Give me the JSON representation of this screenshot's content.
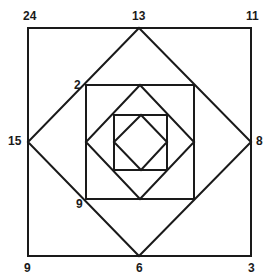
{
  "diagram": {
    "stroke_color": "#1a1a1a",
    "background": "#ffffff",
    "shapes": [
      {
        "type": "square",
        "name": "outer-square",
        "x1": 28,
        "y1": 28,
        "x2": 251,
        "y2": 256
      },
      {
        "type": "diamond",
        "name": "outer-diamond",
        "top": [
          139,
          28
        ],
        "right": [
          251,
          142
        ],
        "bottom": [
          139,
          256
        ],
        "left": [
          28,
          142
        ]
      },
      {
        "type": "square",
        "name": "middle-square",
        "x1": 86,
        "y1": 85,
        "x2": 194,
        "y2": 199
      },
      {
        "type": "diamond",
        "name": "middle-diamond",
        "top": [
          140,
          85
        ],
        "right": [
          194,
          142
        ],
        "bottom": [
          140,
          199
        ],
        "left": [
          86,
          142
        ]
      },
      {
        "type": "square",
        "name": "inner-square",
        "x1": 114,
        "y1": 115,
        "x2": 167,
        "y2": 170
      },
      {
        "type": "diamond",
        "name": "inner-diamond",
        "top": [
          141,
          115
        ],
        "right": [
          167,
          142
        ],
        "bottom": [
          141,
          170
        ],
        "left": [
          114,
          142
        ]
      }
    ],
    "labels": {
      "top_left": "24",
      "top_center": "13",
      "top_right": "11",
      "middle_left": "15",
      "middle_right": "8",
      "bottom_left": "9",
      "bottom_center": "6",
      "bottom_right": "3",
      "inner_upper_left": "2",
      "inner_lower_left": "9"
    }
  }
}
